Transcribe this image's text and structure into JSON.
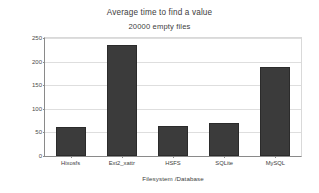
{
  "chart_data": {
    "type": "bar",
    "title": "Average time to find a value",
    "subtitle": "20000 empty files",
    "xlabel": "Filesystem /Database",
    "ylabel": "Time in seconds",
    "categories": [
      "Hixosfs",
      "Ext2_xattr",
      "HSFS",
      "SQLite",
      "MySQL"
    ],
    "values": [
      61,
      236,
      63,
      69,
      189
    ],
    "ylim": [
      0,
      250
    ],
    "yticks": [
      0,
      50,
      100,
      150,
      200,
      250
    ],
    "ytick_labels": [
      "0",
      "50",
      "100",
      "150",
      "200",
      "250"
    ],
    "grid": true,
    "legend": "none",
    "series": [
      {
        "name": "Average time to find a value",
        "values": [
          61,
          236,
          63,
          69,
          189
        ]
      }
    ],
    "colors": {
      "bar_fill": "#3b3b3b",
      "bar_border": "#2b2b2b",
      "gridline": "#dedede",
      "axis": "#8a8a8a",
      "plot_background": "#ffffff",
      "text": "#3d3d3d"
    }
  }
}
